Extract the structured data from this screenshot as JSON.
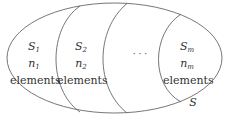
{
  "diagram": {
    "outer_set": "S",
    "subsets": [
      {
        "name": "S",
        "sub": "1",
        "count": "n",
        "count_sub": "1",
        "text": "elements"
      },
      {
        "name": "S",
        "sub": "2",
        "count": "n",
        "count_sub": "2",
        "text": "elements"
      },
      {
        "name": "S",
        "sub": "m",
        "count": "n",
        "count_sub": "m",
        "text": "elements"
      }
    ],
    "ellipsis": "· · ·",
    "stroke_color": "#666666"
  }
}
